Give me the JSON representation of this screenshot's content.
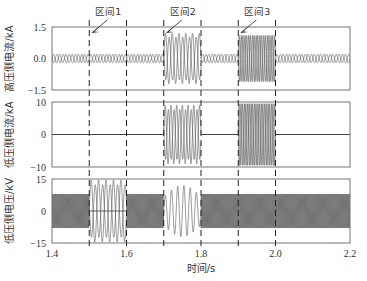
{
  "chart_data": {
    "type": "line",
    "title": "",
    "xlabel": "时间/s",
    "xlim": [
      1.4,
      2.2
    ],
    "xticks": [
      "1.4",
      "1.6",
      "1.8",
      "2.0",
      "2.2"
    ],
    "grid": false,
    "interval_boundaries": [
      1.5,
      1.6,
      1.7,
      1.8,
      1.9,
      2.0
    ],
    "annotations": [
      {
        "label": "区间1",
        "x": 1.5,
        "y_text_px": 14
      },
      {
        "label": "区间2",
        "x": 1.7,
        "y_text_px": 14
      },
      {
        "label": "区间3",
        "x": 1.9,
        "y_text_px": 14
      }
    ],
    "panels": [
      {
        "ylabel": "高压侧电流/kA",
        "ylim": [
          -1.5,
          1.5
        ],
        "yticks": [
          "1.5",
          "0.0",
          "-1.5"
        ],
        "segments": [
          {
            "t0": 1.4,
            "t1": 1.7,
            "amplitude": 0.2,
            "freq": 60,
            "style": "band"
          },
          {
            "t0": 1.7,
            "t1": 1.8,
            "amplitude": 1.2,
            "freq": 55,
            "style": "double"
          },
          {
            "t0": 1.8,
            "t1": 1.9,
            "amplitude": 0.2,
            "freq": 60,
            "style": "band"
          },
          {
            "t0": 1.9,
            "t1": 2.0,
            "amplitude": 1.1,
            "freq": 100,
            "style": "dense"
          },
          {
            "t0": 2.0,
            "t1": 2.2,
            "amplitude": 0.2,
            "freq": 60,
            "style": "band"
          }
        ]
      },
      {
        "ylabel": "低压侧电流/kA",
        "ylim": [
          -10,
          10
        ],
        "yticks": [
          "10",
          "0",
          "-10"
        ],
        "segments": [
          {
            "t0": 1.4,
            "t1": 1.7,
            "amplitude": 0.1,
            "freq": 60,
            "style": "flat"
          },
          {
            "t0": 1.7,
            "t1": 1.8,
            "amplitude": 9,
            "freq": 65,
            "style": "double"
          },
          {
            "t0": 1.8,
            "t1": 1.9,
            "amplitude": 0.1,
            "freq": 60,
            "style": "flat"
          },
          {
            "t0": 1.9,
            "t1": 2.0,
            "amplitude": 9.5,
            "freq": 110,
            "style": "dense"
          },
          {
            "t0": 2.0,
            "t1": 2.2,
            "amplitude": 0.1,
            "freq": 60,
            "style": "flat"
          }
        ]
      },
      {
        "ylabel": "低压侧电压/kV",
        "ylim": [
          -15,
          15
        ],
        "yticks": [
          "15",
          "0",
          "-15"
        ],
        "segments": [
          {
            "t0": 1.4,
            "t1": 1.5,
            "amplitude": 8,
            "freq": 130,
            "style": "band3"
          },
          {
            "t0": 1.5,
            "t1": 1.6,
            "amplitude": 14.5,
            "freq": 50,
            "style": "double"
          },
          {
            "t0": 1.6,
            "t1": 1.7,
            "amplitude": 8,
            "freq": 130,
            "style": "band3"
          },
          {
            "t0": 1.7,
            "t1": 1.8,
            "amplitude": 12,
            "freq": 60,
            "style": "ramp"
          },
          {
            "t0": 1.8,
            "t1": 2.2,
            "amplitude": 8,
            "freq": 130,
            "style": "band3"
          }
        ]
      }
    ]
  }
}
